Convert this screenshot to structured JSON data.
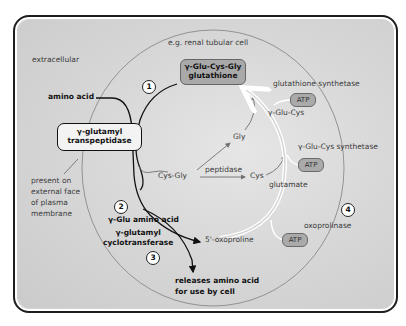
{
  "regions": {
    "extracellular": "extracellular",
    "cell": "e.g. renal tubular cell"
  },
  "steps": [
    "1",
    "2",
    "3",
    "4"
  ],
  "molecules": {
    "amino_acid": "amino acid",
    "glutathione_line1": "γ-Glu-Cys-Gly",
    "glutathione_line2": "glutathione",
    "gly": "Gly",
    "cys_gly": "Cys-Gly",
    "cys": "Cys",
    "glu_cys": "γ-Glu-Cys",
    "glutamate": "glutamate",
    "glu_amino_acid": "γ-Glu amino acid",
    "oxoproline": "5'-oxoproline",
    "release_line1": "releases amino acid",
    "release_line2": "for use by cell"
  },
  "enzymes": {
    "transpeptidase_line1": "γ-glutamyl",
    "transpeptidase_line2": "transpeptidase",
    "transpeptidase_note": [
      "present on",
      "external face",
      "of plasma",
      "membrane"
    ],
    "glutathione_synthetase": "glutathione synthetase",
    "glu_cys_synthetase": "γ-Glu-Cys synthetase",
    "peptidase": "peptidase",
    "cyclotransferase_line1": "γ-glutamyl",
    "cyclotransferase_line2": "cyclotransferase",
    "oxoprolinase": "oxoprolinase"
  },
  "cofactors": {
    "atp1": "ATP",
    "atp2": "ATP",
    "atp3": "ATP"
  },
  "colors": {
    "frame_border": "#1e1e1e",
    "background": "#d2d2d2",
    "cell_membrane": "#8a8a8a",
    "glutathione_box": "#a9a9a9",
    "atp_box": "#aaaaaa",
    "arrow_dark": "#111111",
    "arrow_grey": "#707070",
    "cycle_arrow": "#ffffff"
  }
}
